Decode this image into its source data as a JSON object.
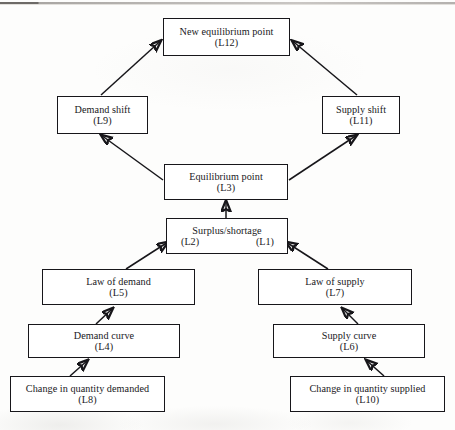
{
  "diagram": {
    "type": "flowchart",
    "nodes": [
      {
        "id": "L12",
        "label": "New equilibrium point",
        "code": "(L12)"
      },
      {
        "id": "L9",
        "label": "Demand shift",
        "code": "(L9)"
      },
      {
        "id": "L11",
        "label": "Supply shift",
        "code": "(L11)"
      },
      {
        "id": "L3",
        "label": "Equilibrium point",
        "code": "(L3)"
      },
      {
        "id": "L2L1",
        "label": "Surplus/shortage",
        "code_left": "(L2)",
        "code_right": "(L1)"
      },
      {
        "id": "L5",
        "label": "Law of demand",
        "code": "(L5)"
      },
      {
        "id": "L7",
        "label": "Law of supply",
        "code": "(L7)"
      },
      {
        "id": "L4",
        "label": "Demand curve",
        "code": "(L4)"
      },
      {
        "id": "L6",
        "label": "Supply curve",
        "code": "(L6)"
      },
      {
        "id": "L8",
        "label": "Change in quantity demanded",
        "code": "(L8)"
      },
      {
        "id": "L10",
        "label": "Change in quantity supplied",
        "code": "(L10)"
      }
    ],
    "edges": [
      {
        "from": "L9",
        "to": "L12",
        "style": "arrow"
      },
      {
        "from": "L11",
        "to": "L12",
        "style": "arrow"
      },
      {
        "from": "L3",
        "to": "L9",
        "style": "arrow"
      },
      {
        "from": "L3",
        "to": "L11",
        "style": "arrow"
      },
      {
        "from": "L2L1",
        "to": "L3",
        "style": "arrow"
      },
      {
        "from": "L5",
        "to": "L2L1",
        "style": "arrow"
      },
      {
        "from": "L7",
        "to": "L2L1",
        "style": "arrow"
      },
      {
        "from": "L4",
        "to": "L5",
        "style": "arrow"
      },
      {
        "from": "L6",
        "to": "L7",
        "style": "arrow"
      },
      {
        "from": "L8",
        "to": "L4",
        "style": "arrow"
      },
      {
        "from": "L10",
        "to": "L6",
        "style": "arrow"
      }
    ],
    "colors": {
      "stroke": "#17161a",
      "box_fill": "#ffffff",
      "page": "#fdfdfc"
    }
  }
}
